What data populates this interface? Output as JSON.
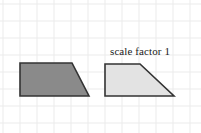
{
  "canvas": {
    "width": 201,
    "height": 133,
    "background_color": "#ffffff"
  },
  "grid": {
    "visible": true,
    "cell_size": 17,
    "line_color": "#ebebeb",
    "major_line_color": "#e0e0e0",
    "origin_x": 3,
    "origin_y": 4
  },
  "labels": {
    "scale_factor": "scale factor 1"
  },
  "shapes": [
    {
      "id": "original-trapezoid",
      "name": "original-shape",
      "role": "pre-image",
      "fill_color": "#8a8a8a",
      "stroke_color": "#333333",
      "stroke_width": 1.6,
      "points": "20,63 72,63 89,96 20,96",
      "vertices": [
        {
          "x": 20,
          "y": 63
        },
        {
          "x": 72,
          "y": 63
        },
        {
          "x": 89,
          "y": 96
        },
        {
          "x": 20,
          "y": 96
        }
      ]
    },
    {
      "id": "image-trapezoid",
      "name": "scaled-shape",
      "role": "image",
      "fill_color": "#e3e3e3",
      "stroke_color": "#333333",
      "stroke_width": 1.6,
      "points": "105,64 140,64 174,96 105,96",
      "vertices": [
        {
          "x": 105,
          "y": 64
        },
        {
          "x": 140,
          "y": 64
        },
        {
          "x": 174,
          "y": 96
        },
        {
          "x": 105,
          "y": 96
        }
      ]
    }
  ]
}
